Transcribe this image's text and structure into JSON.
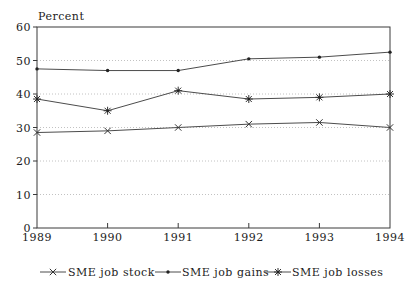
{
  "chart_data": {
    "type": "line",
    "title": "",
    "ylabel": "Percent",
    "xlabel": "",
    "x": [
      "1989",
      "1990",
      "1991",
      "1992",
      "1993",
      "1994"
    ],
    "ylim": [
      0,
      60
    ],
    "yticks": [
      0,
      10,
      20,
      30,
      40,
      50,
      60
    ],
    "grid": "horizontal-dotted",
    "legend_position": "bottom",
    "series": [
      {
        "name": "SME job stock",
        "marker": "x",
        "values": [
          28.5,
          29,
          30,
          31,
          31.5,
          30
        ]
      },
      {
        "name": "SME job gains",
        "marker": "dot",
        "values": [
          47.5,
          47,
          47,
          50.5,
          51,
          52.5
        ]
      },
      {
        "name": "SME job losses",
        "marker": "asterisk",
        "values": [
          38.5,
          35,
          41,
          38.5,
          39,
          40
        ]
      }
    ],
    "colors": {
      "line": "#4c4c4c",
      "grid": "#c2c2c2",
      "text": "#1c1c1c",
      "background": "#ffffff"
    }
  }
}
